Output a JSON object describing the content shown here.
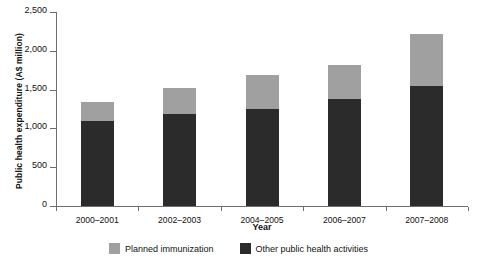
{
  "chart_data": {
    "type": "bar",
    "subtype": "stacked",
    "title": "",
    "xlabel": "Year",
    "ylabel": "Public health expenditure (A$ million)",
    "categories": [
      "2000–2001",
      "2002–2003",
      "2004–2005",
      "2006–2007",
      "2007–2008"
    ],
    "series": [
      {
        "name": "Other public health activities",
        "color": "#2b2b2b",
        "values": [
          1100,
          1180,
          1256,
          1373,
          1541
        ]
      },
      {
        "name": "Planned immunization",
        "color": "#a0a0a0",
        "values": [
          234,
          335,
          428,
          440,
          674
        ]
      }
    ],
    "totals": [
      1334,
      1515,
      1684,
      1813,
      2215
    ],
    "ylim": [
      0,
      2500
    ],
    "yticks": [
      0,
      500,
      1000,
      1500,
      2000,
      2500
    ],
    "ytick_labels": [
      "0",
      "500",
      "1,000",
      "1,500",
      "2,000",
      "2,500"
    ],
    "grid": false,
    "legend_position": "bottom"
  },
  "legend": {
    "items": [
      {
        "label": "Planned immunization",
        "color": "#a0a0a0"
      },
      {
        "label": "Other public health activities",
        "color": "#2b2b2b"
      }
    ]
  },
  "colors": {
    "light_gray": "#a0a0a0",
    "dark_gray": "#2b2b2b",
    "axis": "#6e6e6e",
    "background": "#ffffff"
  }
}
